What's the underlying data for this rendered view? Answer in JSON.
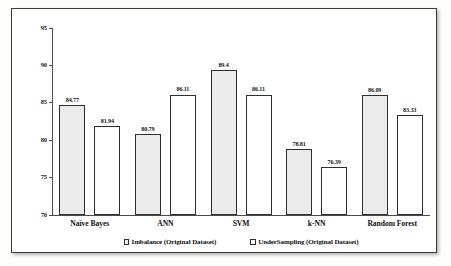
{
  "chart_data": {
    "type": "bar",
    "title": "",
    "xlabel": "",
    "ylabel": "",
    "ylim": [
      70,
      95
    ],
    "yticks": [
      "70",
      "75",
      "80",
      "85",
      "90",
      "95"
    ],
    "grid": false,
    "legend_position": "bottom",
    "categories": [
      "Naïve Bayes",
      "ANN",
      "SVM",
      "k-NN",
      "Random Forest"
    ],
    "series": [
      {
        "name": "Imbalance (Original Dataset)",
        "color": "#ebebeb",
        "values": [
          84.77,
          80.79,
          89.4,
          78.81,
          86.09
        ],
        "labels": [
          "84.77",
          "80.79",
          "89.4",
          "78.81",
          "86.09"
        ]
      },
      {
        "name": "UnderSampling (Original Dataset)",
        "color": "#ffffff",
        "values": [
          81.94,
          86.11,
          86.11,
          76.39,
          83.33
        ],
        "labels": [
          "81.94",
          "86.11",
          "86.11",
          "76.39",
          "83.33"
        ]
      }
    ]
  },
  "colors": {
    "series1_fill": "#ebebeb",
    "series2_fill": "#ffffff",
    "bar_outline": "#2e2e2e",
    "axis": "#4a4a4a",
    "frame": "#3a3a3a",
    "text": "#111111"
  }
}
